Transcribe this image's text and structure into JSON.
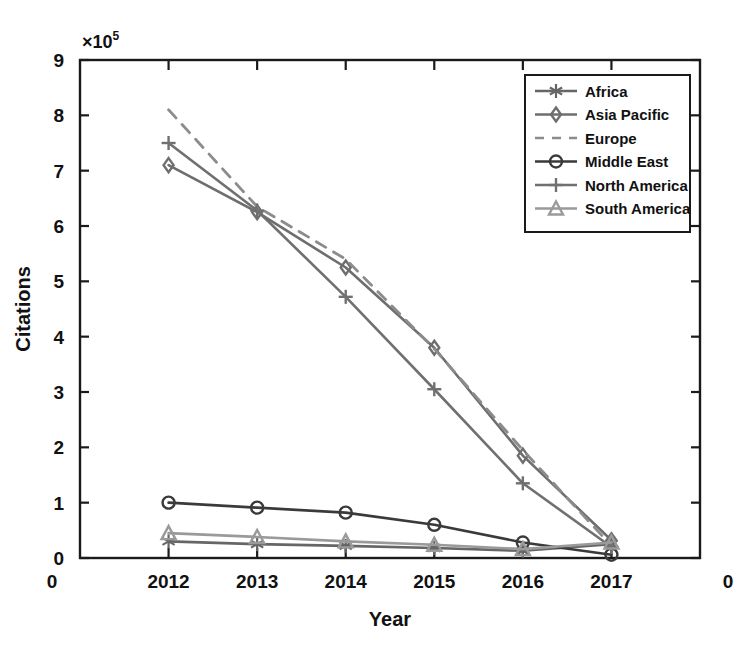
{
  "chart_data": {
    "type": "line",
    "title": "",
    "xlabel": "Year",
    "ylabel": "Citations",
    "y_multiplier_label": "×10",
    "y_multiplier_exponent": "5",
    "categories": [
      "2012",
      "2013",
      "2014",
      "2015",
      "2016",
      "2017"
    ],
    "x_edge_labels": [
      "0",
      "0"
    ],
    "xlim": [
      2011.5,
      2017.5
    ],
    "ylim": [
      0,
      9
    ],
    "ytick_labels": [
      "0",
      "1",
      "2",
      "3",
      "4",
      "5",
      "6",
      "7",
      "8",
      "9"
    ],
    "yticks": [
      0,
      1,
      2,
      3,
      4,
      5,
      6,
      7,
      8,
      9
    ],
    "grid": false,
    "legend_position": "upper right",
    "units_note": "values in units of 1e5",
    "series": [
      {
        "name": "Africa",
        "marker": "asterisk",
        "linestyle": "solid",
        "color": "#666666",
        "values": [
          0.3,
          0.25,
          0.22,
          0.18,
          0.13,
          0.25
        ]
      },
      {
        "name": "Asia Pacific",
        "marker": "diamond",
        "linestyle": "solid",
        "color": "#6e6e6e",
        "values": [
          7.1,
          6.25,
          5.25,
          3.8,
          1.85,
          0.32
        ]
      },
      {
        "name": "Europe",
        "marker": "none",
        "linestyle": "dashed",
        "color": "#8c8c8c",
        "values": [
          8.1,
          6.35,
          5.4,
          3.78,
          1.95,
          0.22
        ]
      },
      {
        "name": "Middle East",
        "marker": "circle",
        "linestyle": "solid",
        "color": "#3a3a3a",
        "values": [
          1.0,
          0.91,
          0.82,
          0.6,
          0.28,
          0.06
        ]
      },
      {
        "name": "North America",
        "marker": "plus",
        "linestyle": "solid",
        "color": "#707070",
        "values": [
          7.5,
          6.28,
          4.72,
          3.05,
          1.35,
          0.2
        ]
      },
      {
        "name": "South America",
        "marker": "triangle",
        "linestyle": "solid",
        "color": "#9a9a9a",
        "values": [
          0.45,
          0.38,
          0.3,
          0.24,
          0.16,
          0.28
        ]
      }
    ]
  },
  "legend": {
    "entries": [
      {
        "label": "Africa"
      },
      {
        "label": "Asia Pacific"
      },
      {
        "label": "Europe"
      },
      {
        "label": "Middle East"
      },
      {
        "label": "North America"
      },
      {
        "label": "South America"
      }
    ]
  }
}
